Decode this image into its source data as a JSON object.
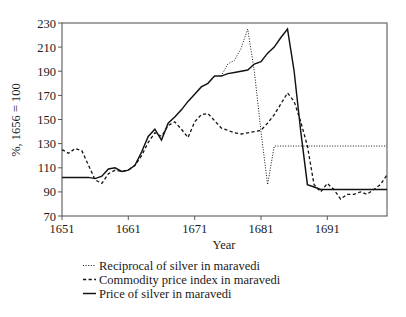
{
  "chart_data": {
    "type": "line",
    "title": "",
    "subtitle": "",
    "xlabel": "Year",
    "ylabel": "%, 1656 = 100",
    "xlim": [
      1651,
      1700
    ],
    "ylim": [
      70,
      230
    ],
    "ytick_labels": [
      "230",
      "210",
      "190",
      "170",
      "150",
      "130",
      "110",
      "90",
      "70"
    ],
    "yticks": [
      230,
      210,
      190,
      170,
      150,
      130,
      110,
      90,
      70
    ],
    "xtick_labels": [
      "1651",
      "1661",
      "1671",
      "1681",
      "1691"
    ],
    "xticks": [
      1651,
      1661,
      1671,
      1681,
      1691
    ],
    "grid": false,
    "legend_position": "below-center",
    "series": [
      {
        "name": "Reciprocal of silver in maravedi",
        "style": "fine-dotted",
        "x": [
          1675,
          1676,
          1677,
          1678,
          1679,
          1680,
          1681,
          1682,
          1683,
          1684,
          1685,
          1686,
          1687,
          1688,
          1689,
          1690,
          1691,
          1692,
          1693,
          1694,
          1695,
          1696,
          1697,
          1698,
          1699,
          1700
        ],
        "values": [
          186,
          196,
          199,
          209,
          225,
          190,
          140,
          96,
          128,
          128,
          128,
          128,
          128,
          128,
          128,
          128,
          128,
          128,
          128,
          128,
          128,
          128,
          128,
          128,
          128,
          128
        ]
      },
      {
        "name": "Commodity price index in maravedi",
        "style": "dashed",
        "x": [
          1651,
          1652,
          1653,
          1654,
          1655,
          1656,
          1657,
          1658,
          1659,
          1660,
          1661,
          1662,
          1663,
          1664,
          1665,
          1666,
          1667,
          1668,
          1669,
          1670,
          1671,
          1672,
          1673,
          1674,
          1675,
          1676,
          1677,
          1678,
          1679,
          1680,
          1681,
          1682,
          1683,
          1684,
          1685,
          1686,
          1687,
          1688,
          1689,
          1690,
          1691,
          1692,
          1693,
          1694,
          1695,
          1696,
          1697,
          1698,
          1699,
          1700
        ],
        "values": [
          125,
          122,
          126,
          124,
          112,
          100,
          97,
          105,
          108,
          107,
          108,
          112,
          120,
          131,
          139,
          136,
          145,
          148,
          142,
          135,
          148,
          154,
          155,
          149,
          143,
          141,
          139,
          138,
          139,
          140,
          141,
          147,
          154,
          163,
          172,
          165,
          148,
          128,
          96,
          90,
          97,
          92,
          84,
          88,
          88,
          90,
          88,
          92,
          96,
          104
        ]
      },
      {
        "name": "Price of silver in maravedi",
        "style": "solid",
        "x": [
          1651,
          1652,
          1653,
          1654,
          1655,
          1656,
          1657,
          1658,
          1659,
          1660,
          1661,
          1662,
          1663,
          1664,
          1665,
          1666,
          1667,
          1668,
          1669,
          1670,
          1671,
          1672,
          1673,
          1674,
          1675,
          1676,
          1677,
          1678,
          1679,
          1680,
          1681,
          1682,
          1683,
          1684,
          1685,
          1686,
          1687,
          1688,
          1689,
          1690,
          1691,
          1692,
          1693,
          1694,
          1695,
          1696,
          1697,
          1698,
          1699,
          1700
        ],
        "values": [
          102,
          102,
          102,
          102,
          102,
          101,
          103,
          109,
          110,
          107,
          108,
          112,
          123,
          136,
          142,
          133,
          147,
          152,
          158,
          165,
          171,
          177,
          180,
          186,
          186,
          188,
          189,
          190,
          191,
          196,
          198,
          205,
          210,
          218,
          225,
          190,
          140,
          96,
          94,
          92,
          92,
          92,
          92,
          92,
          92,
          92,
          92,
          92,
          92,
          92
        ]
      }
    ]
  },
  "legend": {
    "items": [
      {
        "label": "Reciprocal of silver in maravedi",
        "style": "fine-dotted"
      },
      {
        "label": "Commodity price index in maravedi",
        "style": "dashed"
      },
      {
        "label": "Price of silver in maravedi",
        "style": "solid"
      }
    ]
  },
  "colors": {
    "line": "#121212",
    "frame": "#595959",
    "text": "#1a1a1a",
    "background": "#ffffff"
  }
}
